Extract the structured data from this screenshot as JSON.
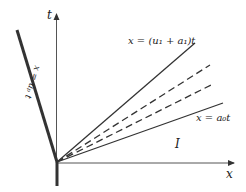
{
  "diagram": {
    "axes": {
      "t_label": "t",
      "x_label": "x"
    },
    "lines": {
      "piston_path": {
        "label": "x = uₚ t",
        "style": "thick-solid"
      },
      "upper_characteristic": {
        "label": "x = (u₁ + a₁)t",
        "style": "solid"
      },
      "fan_dashed_1": {
        "style": "dashed"
      },
      "fan_dashed_2": {
        "style": "dashed"
      },
      "lower_characteristic": {
        "label": "x = a₀t",
        "style": "solid"
      }
    },
    "regions": {
      "region_I": "I"
    },
    "colors": {
      "line": "#333333",
      "background": "#ffffff"
    }
  }
}
